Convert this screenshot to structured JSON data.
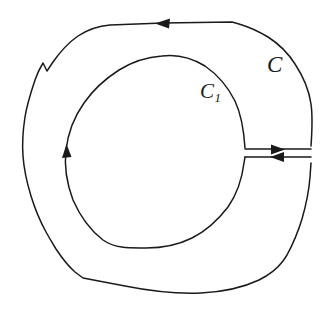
{
  "figure": {
    "kind": "contour-integration-diagram",
    "background_color": "#ffffff",
    "stroke_color": "#1a1a1a",
    "width": 331,
    "height": 313,
    "labels": {
      "outer_curve": "C",
      "inner_curve_base": "C",
      "inner_curve_subscript": "1"
    },
    "curves": [
      {
        "name": "outer-contour",
        "label": "C",
        "shape": "hand-drawn closed loop, slightly irregular rounded polygon",
        "orientation": "counterclockwise",
        "stroke_width": 1.5,
        "cut_open_at": "right side"
      },
      {
        "name": "inner-contour",
        "label": "C1",
        "shape": "near-perfect circle",
        "orientation": "clockwise",
        "stroke_width": 1.5,
        "center_x": 155,
        "center_y": 153,
        "radius": 90,
        "cut_open_at": "right side"
      },
      {
        "name": "cut-channel-upper",
        "shape": "horizontal line joining inner circle to outer contour",
        "direction": "rightward",
        "stroke_width": 1.5
      },
      {
        "name": "cut-channel-lower",
        "shape": "horizontal line joining outer contour back to inner circle",
        "direction": "leftward",
        "stroke_width": 1.5
      }
    ],
    "arrows": [
      {
        "name": "outer-top-arrow",
        "on_curve": "outer-contour",
        "points": "left",
        "x": 163,
        "y": 23
      },
      {
        "name": "inner-left-arrow",
        "on_curve": "inner-contour",
        "points": "up",
        "x": 66,
        "y": 152
      },
      {
        "name": "cut-upper-arrow",
        "on_curve": "cut-channel-upper",
        "points": "right",
        "x": 279,
        "y": 150
      },
      {
        "name": "cut-lower-arrow",
        "on_curve": "cut-channel-lower",
        "points": "left",
        "x": 292,
        "y": 157
      }
    ]
  }
}
